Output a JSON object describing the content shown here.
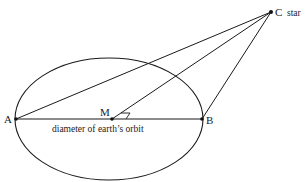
{
  "diagram": {
    "colors": {
      "line": "#1a1a1a",
      "text": "#222222",
      "background": "#ffffff"
    },
    "orbit": {
      "cx": 109,
      "cy": 119,
      "rx": 94,
      "ry": 61
    },
    "points": {
      "A": {
        "label": "A",
        "x": 16,
        "y": 119
      },
      "B": {
        "label": "B",
        "x": 202,
        "y": 119
      },
      "M": {
        "label": "M",
        "x": 112,
        "y": 119
      },
      "C": {
        "label": "C",
        "x": 271,
        "y": 12
      }
    },
    "star_label": "star",
    "diameter_label": "diameter of earth’s orbit",
    "segments": [
      [
        "A",
        "B"
      ],
      [
        "A",
        "C"
      ],
      [
        "M",
        "C"
      ],
      [
        "B",
        "C"
      ]
    ]
  }
}
